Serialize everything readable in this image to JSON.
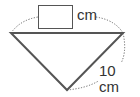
{
  "diagram": {
    "shape": "right isosceles triangle",
    "answer_box": {
      "value": "",
      "unit": "cm"
    },
    "side_label": {
      "value": "10",
      "unit": "cm",
      "text": "10 cm"
    },
    "top_unit_text": "cm",
    "colors": {
      "line": "#555555",
      "dotted": "#666666",
      "box_border": "#555555",
      "text": "#333333"
    }
  }
}
